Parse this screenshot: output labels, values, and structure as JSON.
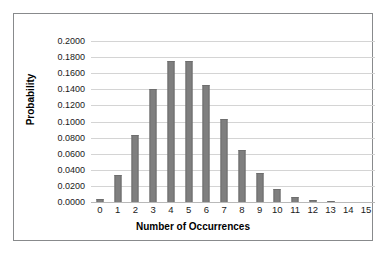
{
  "chart_data": {
    "type": "bar",
    "title": "",
    "subtitle": "",
    "xlabel": "Number of Occurrences",
    "ylabel": "Probability",
    "categories": [
      "0",
      "1",
      "2",
      "3",
      "4",
      "5",
      "6",
      "7",
      "8",
      "9",
      "10",
      "11",
      "12",
      "13",
      "14",
      "15"
    ],
    "values": [
      0.004,
      0.0335,
      0.083,
      0.14,
      0.1755,
      0.1755,
      0.1455,
      0.103,
      0.064,
      0.0355,
      0.0165,
      0.0065,
      0.002,
      0.0005,
      0.0001,
      0.0
    ],
    "series": [
      {
        "name": "Probability",
        "values": [
          0.004,
          0.0335,
          0.083,
          0.14,
          0.1755,
          0.1755,
          0.1455,
          0.103,
          0.064,
          0.0355,
          0.0165,
          0.0065,
          0.002,
          0.0005,
          0.0001,
          0.0
        ]
      }
    ],
    "ylim": [
      0.0,
      0.2
    ],
    "ytick_step": 0.02,
    "ytick_labels": [
      "0.2000",
      "0.1800",
      "0.1600",
      "0.1400",
      "0.1200",
      "0.1000",
      "0.0800",
      "0.0600",
      "0.0400",
      "0.0200",
      "0.0000"
    ],
    "ytick_values": [
      0.2,
      0.18,
      0.16,
      0.14,
      0.12,
      0.1,
      0.08,
      0.06,
      0.04,
      0.02,
      0.0
    ],
    "xtick_labels": [
      "0",
      "1",
      "2",
      "3",
      "4",
      "5",
      "6",
      "7",
      "8",
      "9",
      "10",
      "11",
      "12",
      "13",
      "14",
      "15"
    ],
    "grid": true,
    "grid_axis": "y",
    "legend": false,
    "legend_position": "none",
    "bar_color": "#7f7f7f",
    "gridline_color": "#d4d4d4",
    "border_color": "#888a8c",
    "background_color": "#ffffff",
    "text_color": "#1a1a1a"
  }
}
